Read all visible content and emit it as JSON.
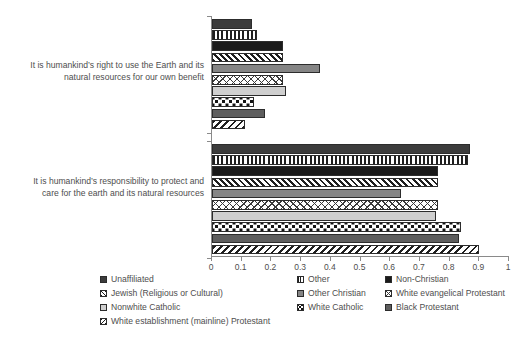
{
  "chart_data": {
    "type": "bar",
    "orientation": "horizontal",
    "title": "",
    "xlabel": "",
    "ylabel": "",
    "xlim": [
      0,
      1
    ],
    "grid": false,
    "legend_position": "bottom",
    "tick_labels": [
      "0",
      "0.1",
      "0.2",
      "0.3",
      "0.4",
      "0.5",
      "0.6",
      "0.7",
      "0.8",
      "0.9",
      "1"
    ],
    "tick_values": [
      0,
      0.1,
      0.2,
      0.3,
      0.4,
      0.5,
      0.6,
      0.7,
      0.8,
      0.9,
      1
    ],
    "categories": [
      "It is humankind’s right to use the Earth and its natural resources for our own benefit",
      "It is humankind’s responsibility to protect and care for the earth and its natural resources"
    ],
    "category_lines": [
      [
        "It is humankind’s right to use the Earth and its",
        "natural resources for our own benefit"
      ],
      [
        "It is humankind’s responsibility to protect and",
        "care for the earth and its natural resources"
      ]
    ],
    "series": [
      {
        "name": "Unaffiliated",
        "pattern": "solid-dark",
        "values": [
          0.135,
          0.87
        ]
      },
      {
        "name": "Other",
        "pattern": "vline",
        "values": [
          0.15,
          0.862
        ]
      },
      {
        "name": "Non-Christian",
        "pattern": "solid-black",
        "values": [
          0.24,
          0.76
        ]
      },
      {
        "name": "Jewish (Religious or Cultural)",
        "pattern": "diag-f",
        "values": [
          0.24,
          0.762
        ]
      },
      {
        "name": "Other Christian",
        "pattern": "solid-mid",
        "values": [
          0.365,
          0.635
        ]
      },
      {
        "name": "White evangelical Protestant",
        "pattern": "cross",
        "values": [
          0.24,
          0.76
        ]
      },
      {
        "name": "Nonwhite Catholic",
        "pattern": "solid-light",
        "values": [
          0.25,
          0.755
        ]
      },
      {
        "name": "White Catholic",
        "pattern": "dots",
        "values": [
          0.14,
          0.84
        ]
      },
      {
        "name": "Black Protestant",
        "pattern": "solid-medgray",
        "values": [
          0.18,
          0.83
        ]
      },
      {
        "name": "White establishment (mainline) Protestant",
        "pattern": "diag-b",
        "values": [
          0.11,
          0.9
        ]
      }
    ]
  },
  "legend": {
    "items": [
      {
        "label": "Unaffiliated",
        "pattern": "solid-dark",
        "col": 0,
        "row": 0
      },
      {
        "label": "Other",
        "pattern": "vline",
        "col": 1,
        "row": 0
      },
      {
        "label": "Non-Christian",
        "pattern": "solid-black",
        "col": 2,
        "row": 0
      },
      {
        "label": "Jewish (Religious or Cultural)",
        "pattern": "diag-f",
        "col": 0,
        "row": 1
      },
      {
        "label": "Other Christian",
        "pattern": "solid-mid",
        "col": 1,
        "row": 1
      },
      {
        "label": "White evangelical Protestant",
        "pattern": "cross",
        "col": 2,
        "row": 1
      },
      {
        "label": "Nonwhite Catholic",
        "pattern": "solid-light",
        "col": 0,
        "row": 2
      },
      {
        "label": "White Catholic",
        "pattern": "dots",
        "col": 1,
        "row": 2
      },
      {
        "label": "Black Protestant",
        "pattern": "solid-medgray",
        "col": 2,
        "row": 2
      },
      {
        "label": "White establishment (mainline) Protestant",
        "pattern": "diag-b",
        "col": 0,
        "row": 3
      }
    ]
  },
  "colors": {
    "axis": "#8a8a8a",
    "text": "#4e4e4e",
    "bar_outline": "#2c2c2c"
  }
}
